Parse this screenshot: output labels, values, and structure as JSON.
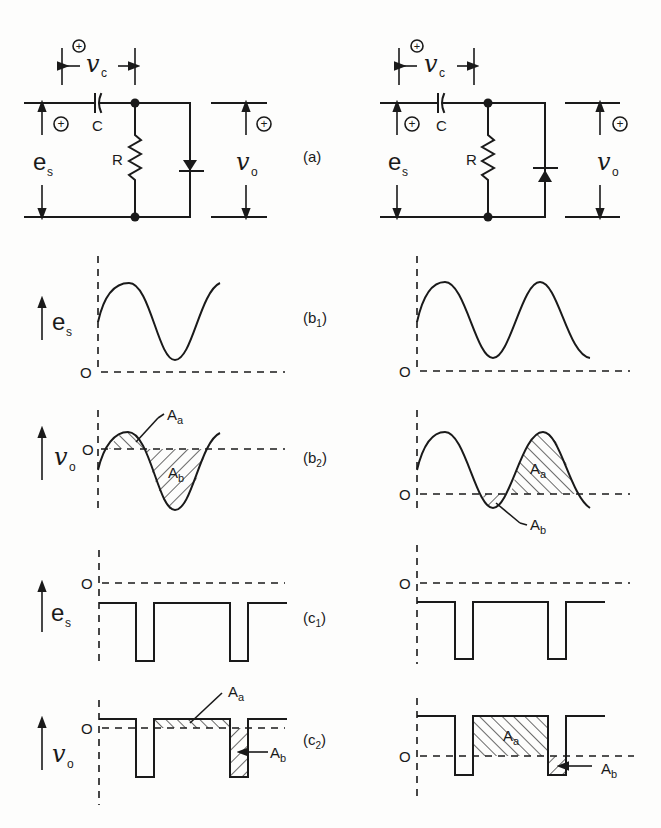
{
  "figure": {
    "type": "diode clamper circuits and waveforms",
    "panel_labels": {
      "a": "(a)",
      "b1": "(b",
      "b1_sub": "1",
      "b2": "(b",
      "b2_sub": "2",
      "c1": "(c",
      "c1_sub": "1",
      "c2": "(c",
      "c2_sub": "2",
      "close": ")"
    },
    "circuit": {
      "source_label": "e",
      "source_sub": "s",
      "cap_voltage_label": "v",
      "cap_voltage_sub": "c",
      "capacitor_label": "C",
      "resistor_label": "R",
      "output_label": "v",
      "output_sub": "o",
      "plus_sign": "+"
    },
    "waveforms": {
      "es_label": "e",
      "es_sub": "s",
      "vo_label": "v",
      "vo_sub": "o",
      "zero_label": "O",
      "area_a_label": "A",
      "area_a_sub": "a",
      "area_b_label": "A",
      "area_b_sub": "b"
    },
    "columns": [
      {
        "name": "left",
        "diode_orientation": "cathode-up (conducts downward)"
      },
      {
        "name": "right",
        "diode_orientation": "anode-down (conducts upward)"
      }
    ],
    "colors": {
      "ink": "#1a1a1a",
      "paper": "#fdfdfc"
    }
  }
}
